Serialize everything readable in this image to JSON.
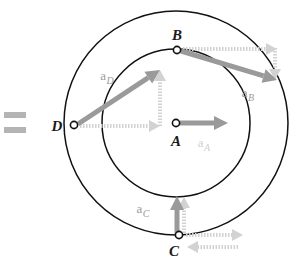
{
  "figure": {
    "type": "physics-vector-diagram",
    "background_color": "#ffffff",
    "accent_color": "#9a9a9a",
    "dashed_color": "#d2d2d2",
    "stroke_color": "#111111"
  },
  "equals_symbol": {
    "name": "equals-sign",
    "text": "=",
    "color": "#b4b4b4",
    "x": 4,
    "y": 112,
    "bar_width": 22,
    "bar_height": 6,
    "bar_gap": 9
  },
  "circles": [
    {
      "name": "inner-circle",
      "cx": 176,
      "cy": 123,
      "r": 74
    },
    {
      "name": "outer-circle",
      "cx": 176,
      "cy": 123,
      "r": 112
    }
  ],
  "points": [
    {
      "id": "A",
      "label": "A",
      "cx": 176,
      "cy": 123,
      "label_x": 176,
      "label_y": 146,
      "dot_r": 3.6
    },
    {
      "id": "B",
      "label": "B",
      "cx": 177,
      "cy": 50,
      "label_x": 177,
      "label_y": 40,
      "dot_r": 3.6
    },
    {
      "id": "C",
      "label": "C",
      "cx": 179,
      "cy": 235,
      "label_x": 174,
      "label_y": 256,
      "dot_r": 3.6
    },
    {
      "id": "D",
      "label": "D",
      "cx": 74,
      "cy": 125,
      "label_x": 57,
      "label_y": 131,
      "dot_r": 3.6
    }
  ],
  "vectors": [
    {
      "id": "aA",
      "label_main": "a",
      "label_sub": "A",
      "label_x": 204,
      "label_y": 147,
      "label_faint": true,
      "from": {
        "x": 180,
        "y": 123
      },
      "to": {
        "x": 228,
        "y": 123
      },
      "style": "solid"
    },
    {
      "id": "aB",
      "label_main": "a",
      "label_sub": "B",
      "label_x": 248,
      "label_y": 97,
      "label_faint": false,
      "from": {
        "x": 181,
        "y": 51
      },
      "to": {
        "x": 277,
        "y": 80
      },
      "style": "solid"
    },
    {
      "id": "aC",
      "label_main": "a",
      "label_sub": "C",
      "label_x": 143,
      "label_y": 213,
      "label_faint": false,
      "from": {
        "x": 177,
        "y": 234
      },
      "to": {
        "x": 177,
        "y": 196
      },
      "style": "solid"
    },
    {
      "id": "aD",
      "label_main": "a",
      "label_sub": "D",
      "label_x": 107,
      "label_y": 80,
      "label_faint": false,
      "from": {
        "x": 78,
        "y": 124
      },
      "to": {
        "x": 160,
        "y": 70
      },
      "style": "solid"
    }
  ],
  "component_vectors": [
    {
      "id": "B-horizontal",
      "name": "b-horizontal-component",
      "from": {
        "x": 183,
        "y": 49
      },
      "to": {
        "x": 277,
        "y": 49
      },
      "orientation": "horizontal",
      "direction": "right"
    },
    {
      "id": "B-vertical",
      "name": "b-vertical-component",
      "from": {
        "x": 275,
        "y": 48
      },
      "to": {
        "x": 275,
        "y": 80
      },
      "orientation": "vertical",
      "direction": "down"
    },
    {
      "id": "D-horizontal",
      "name": "d-horizontal-component",
      "from": {
        "x": 80,
        "y": 126
      },
      "to": {
        "x": 160,
        "y": 126
      },
      "orientation": "horizontal",
      "direction": "right"
    },
    {
      "id": "D-vertical",
      "name": "d-vertical-component",
      "from": {
        "x": 160,
        "y": 126
      },
      "to": {
        "x": 160,
        "y": 70
      },
      "orientation": "vertical",
      "direction": "up"
    },
    {
      "id": "C-vertical",
      "name": "c-vertical-component",
      "from": {
        "x": 184,
        "y": 233
      },
      "to": {
        "x": 184,
        "y": 197
      },
      "orientation": "vertical",
      "direction": "up"
    },
    {
      "id": "C-horizontal-right",
      "name": "c-horizontal-component-right",
      "from": {
        "x": 186,
        "y": 235
      },
      "to": {
        "x": 243,
        "y": 235
      },
      "orientation": "horizontal",
      "direction": "right"
    },
    {
      "id": "C-horizontal-left",
      "name": "c-horizontal-component-left",
      "from": {
        "x": 238,
        "y": 247
      },
      "to": {
        "x": 187,
        "y": 247
      },
      "orientation": "horizontal",
      "direction": "left"
    }
  ],
  "chart_data": {
    "type": "scatter",
    "title": "",
    "xlabel": "",
    "ylabel": "",
    "annotations": [
      "A",
      "B",
      "C",
      "D",
      "a_A",
      "a_B",
      "a_C",
      "a_D",
      "="
    ]
  }
}
